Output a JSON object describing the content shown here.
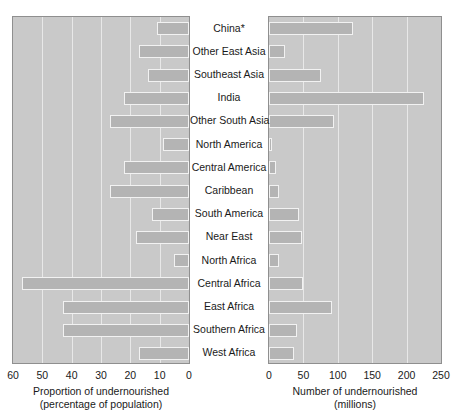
{
  "chart_data": {
    "type": "bar",
    "orientation": "horizontal",
    "layout": "paired-pyramid",
    "categories": [
      "China*",
      "Other East Asia",
      "Southeast Asia",
      "India",
      "Other South Asia",
      "North America",
      "Central America",
      "Caribbean",
      "South America",
      "Near East",
      "North Africa",
      "Central Africa",
      "East Africa",
      "Southern Africa",
      "West Africa"
    ],
    "panels": [
      {
        "id": "proportion",
        "position": "left",
        "direction": "right-to-left",
        "xlabel_line1": "Proportion of undernourished",
        "xlabel_line2": "(percentage of population)",
        "ticks": [
          60,
          50,
          40,
          30,
          20,
          10,
          0
        ],
        "xlim": [
          60,
          0
        ],
        "values": [
          11,
          17,
          14,
          22,
          27,
          9,
          22,
          27,
          12.5,
          18,
          5,
          57,
          43,
          43,
          17
        ],
        "grid": true
      },
      {
        "id": "number",
        "position": "right",
        "direction": "left-to-right",
        "xlabel_line1": "Number of undernourished",
        "xlabel_line2": "(millions)",
        "ticks": [
          0,
          50,
          100,
          150,
          200,
          250
        ],
        "xlim": [
          0,
          250
        ],
        "values": [
          122,
          23,
          76,
          225,
          94,
          4,
          10,
          14,
          43,
          48,
          14,
          50,
          91,
          41,
          36
        ],
        "grid": true
      }
    ],
    "colors": {
      "panel_background": "#c9c9c9",
      "bar_fill": "#b4b4b4",
      "bar_edge": "#f2f2f2",
      "gridline": "#e8e8e8",
      "panel_border": "#8f8f8f",
      "text": "#1a1a1a",
      "page_background": "#ffffff"
    }
  }
}
